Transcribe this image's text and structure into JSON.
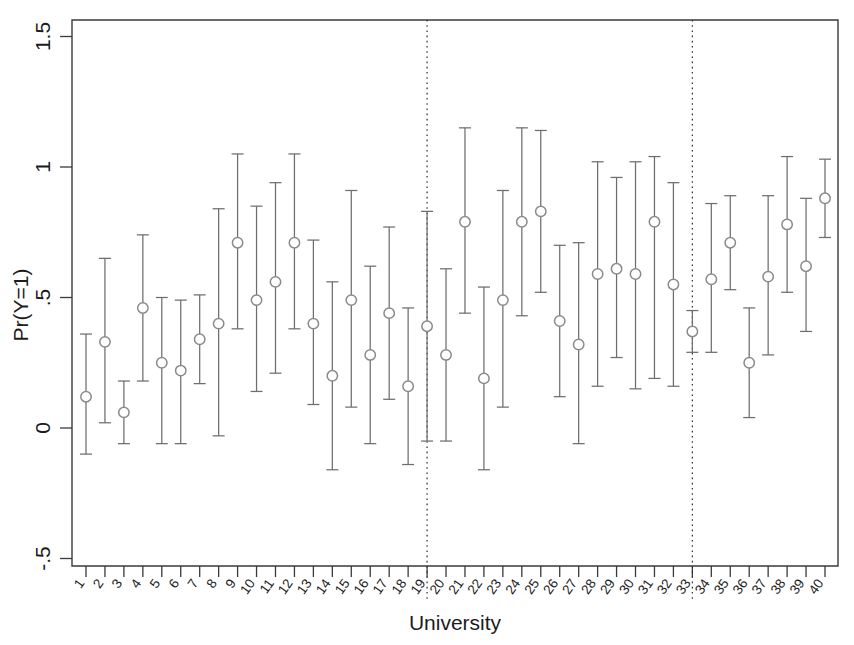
{
  "chart_data": {
    "type": "scatter",
    "title": "",
    "xlabel": "University",
    "ylabel": "Pr(Y=1)",
    "ylim": [
      -0.5,
      1.5
    ],
    "yticks": [
      -0.5,
      0,
      0.5,
      1,
      1.5
    ],
    "ytick_labels": [
      "-.5",
      "0",
      ".5",
      "1",
      "1.5"
    ],
    "grid": false,
    "legend": "none",
    "error_bars": "95% confidence interval",
    "annotations": [
      {
        "type": "vertical-dotted-line",
        "x": 19
      },
      {
        "type": "vertical-dotted-line",
        "x": 33
      }
    ],
    "categories": [
      "1",
      "2",
      "3",
      "4",
      "5",
      "6",
      "7",
      "8",
      "9",
      "10",
      "11",
      "12",
      "13",
      "14",
      "15",
      "16",
      "17",
      "18",
      "19",
      "20",
      "21",
      "22",
      "23",
      "24",
      "25",
      "26",
      "27",
      "28",
      "29",
      "30",
      "31",
      "32",
      "33",
      "34",
      "35",
      "36",
      "37",
      "38",
      "39",
      "40"
    ],
    "series": [
      {
        "name": "Pr(Y=1)",
        "values": [
          0.12,
          0.33,
          0.06,
          0.46,
          0.25,
          0.22,
          0.34,
          0.4,
          0.71,
          0.49,
          0.56,
          0.71,
          0.4,
          0.2,
          0.49,
          0.28,
          0.44,
          0.16,
          0.39,
          0.28,
          0.79,
          0.19,
          0.49,
          0.79,
          0.83,
          0.41,
          0.32,
          0.59,
          0.61,
          0.59,
          0.79,
          0.55,
          0.37,
          0.57,
          0.71,
          0.25,
          0.58,
          0.78,
          0.62,
          0.88
        ],
        "ci_lower": [
          -0.1,
          0.02,
          -0.06,
          0.18,
          -0.06,
          -0.06,
          0.17,
          -0.03,
          0.38,
          0.14,
          0.21,
          0.38,
          0.09,
          -0.16,
          0.08,
          -0.06,
          0.11,
          -0.14,
          -0.05,
          -0.05,
          0.44,
          -0.16,
          0.08,
          0.43,
          0.52,
          0.12,
          -0.06,
          0.16,
          0.27,
          0.15,
          0.19,
          0.16,
          0.29,
          0.29,
          0.53,
          0.04,
          0.28,
          0.52,
          0.37,
          0.73
        ],
        "ci_upper": [
          0.36,
          0.65,
          0.18,
          0.74,
          0.5,
          0.49,
          0.51,
          0.84,
          1.05,
          0.85,
          0.94,
          1.05,
          0.72,
          0.56,
          0.91,
          0.62,
          0.77,
          0.46,
          0.83,
          0.61,
          1.15,
          0.54,
          0.91,
          1.15,
          1.14,
          0.7,
          0.71,
          1.02,
          0.96,
          1.02,
          1.04,
          0.94,
          0.45,
          0.86,
          0.89,
          0.46,
          0.89,
          1.04,
          0.88,
          1.03
        ]
      }
    ]
  },
  "figure": {
    "ylabel": "Pr(Y=1)",
    "xlabel": "University"
  }
}
